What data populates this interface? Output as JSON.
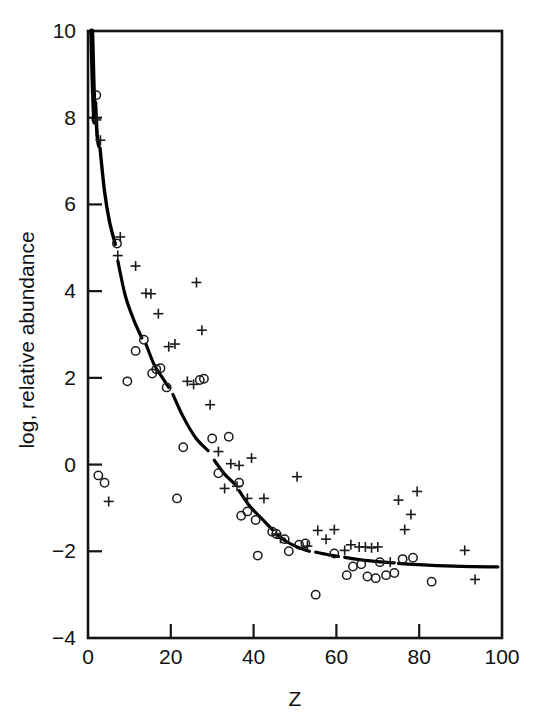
{
  "chart_data": {
    "type": "scatter",
    "title": "",
    "xlabel": "Z",
    "ylabel": "log, relative abundance",
    "xlim": [
      0,
      100
    ],
    "ylim": [
      -4,
      10
    ],
    "grid": false,
    "legend": "none",
    "xticks": [
      0,
      20,
      40,
      60,
      80,
      100
    ],
    "xtick_labels": [
      "0",
      "20",
      "40",
      "60",
      "80",
      "100"
    ],
    "yticks": [
      -4,
      -2,
      0,
      2,
      4,
      6,
      8,
      10
    ],
    "ytick_labels": [
      "−4",
      "−2",
      "0",
      "2",
      "4",
      "6",
      "8",
      "10"
    ],
    "series": [
      {
        "name": "open-circle-series",
        "marker": "circle",
        "color": "#1b1b1b",
        "points": [
          [
            2,
            8.52
          ],
          [
            2.5,
            -0.25
          ],
          [
            4,
            -0.42
          ],
          [
            7,
            5.1
          ],
          [
            9.5,
            1.92
          ],
          [
            11.5,
            2.62
          ],
          [
            13.5,
            2.88
          ],
          [
            15.5,
            2.1
          ],
          [
            16.5,
            2.2
          ],
          [
            17.5,
            2.22
          ],
          [
            19,
            1.78
          ],
          [
            21.5,
            -0.78
          ],
          [
            23,
            0.4
          ],
          [
            27,
            1.95
          ],
          [
            28,
            1.98
          ],
          [
            30,
            0.6
          ],
          [
            31.5,
            -0.2
          ],
          [
            34,
            0.64
          ],
          [
            36.5,
            -0.42
          ],
          [
            37,
            -1.18
          ],
          [
            38.5,
            -1.08
          ],
          [
            41,
            -2.1
          ],
          [
            40.5,
            -1.28
          ],
          [
            44.5,
            -1.55
          ],
          [
            45.5,
            -1.6
          ],
          [
            47.5,
            -1.72
          ],
          [
            48.5,
            -2.0
          ],
          [
            51,
            -1.85
          ],
          [
            52.5,
            -1.82
          ],
          [
            55,
            -3.0
          ],
          [
            59.5,
            -2.05
          ],
          [
            62.5,
            -2.55
          ],
          [
            64,
            -2.35
          ],
          [
            66,
            -2.3
          ],
          [
            67.5,
            -2.58
          ],
          [
            69.5,
            -2.62
          ],
          [
            70.5,
            -2.25
          ],
          [
            72,
            -2.55
          ],
          [
            74,
            -2.5
          ],
          [
            76,
            -2.18
          ],
          [
            78.5,
            -2.15
          ],
          [
            83,
            -2.7
          ]
        ]
      },
      {
        "name": "plus-series",
        "marker": "plus",
        "color": "#1b1b1b",
        "points": [
          [
            2,
            7.95
          ],
          [
            3,
            7.48
          ],
          [
            5,
            -0.85
          ],
          [
            7.8,
            5.25
          ],
          [
            7.2,
            4.82
          ],
          [
            11.5,
            4.58
          ],
          [
            14,
            3.95
          ],
          [
            15.2,
            3.94
          ],
          [
            17,
            3.48
          ],
          [
            19.5,
            2.72
          ],
          [
            21,
            2.78
          ],
          [
            24,
            1.92
          ],
          [
            25.5,
            1.85
          ],
          [
            26.2,
            4.2
          ],
          [
            27.5,
            3.1
          ],
          [
            29.5,
            1.38
          ],
          [
            31.5,
            0.3
          ],
          [
            33,
            -0.55
          ],
          [
            34.5,
            0.02
          ],
          [
            36.5,
            -0.02
          ],
          [
            36,
            -0.5
          ],
          [
            38.5,
            -0.78
          ],
          [
            39.5,
            0.15
          ],
          [
            42.5,
            -0.78
          ],
          [
            45.5,
            -1.6
          ],
          [
            46.5,
            -1.7
          ],
          [
            50.5,
            -0.28
          ],
          [
            53,
            -1.88
          ],
          [
            55.5,
            -1.52
          ],
          [
            57.5,
            -1.72
          ],
          [
            59.5,
            -1.5
          ],
          [
            62,
            -1.98
          ],
          [
            63.5,
            -1.85
          ],
          [
            65.5,
            -1.9
          ],
          [
            67,
            -1.9
          ],
          [
            68.5,
            -1.92
          ],
          [
            70,
            -1.9
          ],
          [
            73,
            -2.25
          ],
          [
            75,
            -0.82
          ],
          [
            76.5,
            -1.5
          ],
          [
            78,
            -1.15
          ],
          [
            79.5,
            -0.62
          ],
          [
            91,
            -1.98
          ],
          [
            93.5,
            -2.65
          ]
        ]
      }
    ],
    "fit_curve": {
      "name": "smooth-abundance-fit",
      "color": "#000000",
      "description": "heavy descending curve, steep at low Z, flattening near -2.35 at high Z",
      "segments": [
        {
          "width": 5.0,
          "points": [
            [
              0.9,
              10.0
            ],
            [
              1.1,
              9.3
            ],
            [
              1.3,
              8.6
            ],
            [
              1.6,
              7.9
            ]
          ]
        },
        {
          "width": 3.6,
          "points": [
            [
              1.8,
              8.35
            ],
            [
              2.2,
              7.6
            ],
            [
              2.6,
              7.35
            ]
          ]
        },
        {
          "width": 3.4,
          "points": [
            [
              2.9,
              7.3
            ],
            [
              4.0,
              6.3
            ],
            [
              5.2,
              5.6
            ],
            [
              6.6,
              5.08
            ]
          ]
        },
        {
          "width": 3.2,
          "points": [
            [
              7.2,
              4.7
            ],
            [
              9.0,
              3.9
            ],
            [
              11.0,
              3.35
            ],
            [
              13.0,
              2.92
            ]
          ]
        },
        {
          "width": 3.2,
          "points": [
            [
              14.0,
              2.78
            ],
            [
              16.0,
              2.3
            ],
            [
              18.0,
              2.0
            ],
            [
              19.5,
              1.78
            ]
          ]
        },
        {
          "width": 3.2,
          "points": [
            [
              20.5,
              1.62
            ],
            [
              23.0,
              1.1
            ],
            [
              26.0,
              0.62
            ],
            [
              29.0,
              0.32
            ]
          ]
        },
        {
          "width": 3.2,
          "points": [
            [
              30.5,
              0.1
            ],
            [
              33.0,
              -0.22
            ],
            [
              35.5,
              -0.45
            ]
          ]
        },
        {
          "width": 3.2,
          "points": [
            [
              36.5,
              -0.6
            ],
            [
              39.0,
              -0.95
            ],
            [
              42.0,
              -1.25
            ],
            [
              44.5,
              -1.5
            ]
          ]
        },
        {
          "width": 3.2,
          "points": [
            [
              45.5,
              -1.6
            ],
            [
              48.0,
              -1.78
            ],
            [
              51.0,
              -1.92
            ],
            [
              53.5,
              -2.0
            ]
          ]
        },
        {
          "width": 3.2,
          "points": [
            [
              55.0,
              -2.02
            ],
            [
              58.0,
              -2.08
            ],
            [
              60.5,
              -2.12
            ]
          ]
        },
        {
          "width": 3.2,
          "points": [
            [
              62.0,
              -2.14
            ],
            [
              66.0,
              -2.2
            ],
            [
              70.0,
              -2.24
            ],
            [
              74.0,
              -2.27
            ]
          ]
        },
        {
          "width": 3.2,
          "points": [
            [
              75.0,
              -2.28
            ],
            [
              82.0,
              -2.32
            ],
            [
              90.0,
              -2.35
            ],
            [
              99.0,
              -2.36
            ]
          ]
        }
      ]
    }
  },
  "figure": {
    "background_color": "#ffffff",
    "ink_color": "#111111"
  }
}
